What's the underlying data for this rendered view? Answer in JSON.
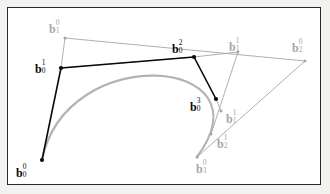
{
  "figure": {
    "type": "geometric-diagram",
    "background_color": "#f2f2f0",
    "panel_color": "#ffffff",
    "border_color": "#2a2a2a",
    "dark_color": "#0a0a0a",
    "gray_color": "#a6a6a6",
    "curve_color": "#b3b3b3"
  },
  "points": [
    {
      "id": "b0_0",
      "base": "b",
      "sub": "0",
      "sup": "0",
      "x": 42,
      "y": 160,
      "color": "dark",
      "label_x": 16,
      "label_y": 164,
      "dot": true
    },
    {
      "id": "b0_1",
      "base": "b",
      "sub": "0",
      "sup": "1",
      "x": 61,
      "y": 68,
      "color": "dark",
      "label_x": 35,
      "label_y": 60,
      "dot": true
    },
    {
      "id": "b0_2",
      "base": "b",
      "sub": "0",
      "sup": "2",
      "x": 194,
      "y": 57,
      "color": "dark",
      "label_x": 172,
      "label_y": 40,
      "dot": true
    },
    {
      "id": "b0_3",
      "base": "b",
      "sub": "0",
      "sup": "3",
      "x": 216,
      "y": 99,
      "color": "dark",
      "label_x": 190,
      "label_y": 98,
      "dot": true
    },
    {
      "id": "b1_0",
      "base": "b",
      "sub": "1",
      "sup": "0",
      "x": 65,
      "y": 38,
      "color": "gray",
      "label_x": 49,
      "label_y": 20,
      "dot": true
    },
    {
      "id": "b1_1",
      "base": "b",
      "sub": "1",
      "sup": "1",
      "x": 238,
      "y": 52,
      "color": "gray",
      "label_x": 229,
      "label_y": 38,
      "dot": true
    },
    {
      "id": "b1_1b",
      "base": "b",
      "sub": "1",
      "sup": "1",
      "x": 221,
      "y": 111,
      "color": "gray",
      "label_x": 226,
      "label_y": 110,
      "dot": true
    },
    {
      "id": "b2_0",
      "base": "b",
      "sub": "2",
      "sup": "0",
      "x": 305,
      "y": 61,
      "color": "gray",
      "label_x": 292,
      "label_y": 39,
      "dot": true
    },
    {
      "id": "b2_1",
      "base": "b",
      "sub": "2",
      "sup": "1",
      "x": 211,
      "y": 134,
      "color": "gray",
      "label_x": 217,
      "label_y": 135,
      "dot": true
    },
    {
      "id": "b3_0",
      "base": "b",
      "sub": "3",
      "sup": "0",
      "x": 197,
      "y": 157,
      "color": "gray",
      "label_x": 196,
      "label_y": 160,
      "dot": true
    }
  ],
  "polylines": [
    {
      "name": "original-control-polygon",
      "color": "#a6a6a6",
      "width": 0.9,
      "path": "61,68 65,38 305,61 197,157"
    },
    {
      "name": "first-subdivision-polygon",
      "color": "#a6a6a6",
      "width": 0.9,
      "path": "61,68 194,57 238,52 211,134"
    },
    {
      "name": "second-subdivision-polygon",
      "color": "#a6a6a6",
      "width": 0.9,
      "path": "194,57 216,99 221,111"
    },
    {
      "name": "casteljau-polygon-dark",
      "color": "#0a0a0a",
      "width": 1.6,
      "path": "42,160 61,68 194,57 216,99"
    }
  ],
  "curve": {
    "name": "cubic-bezier-curve",
    "color": "#b3b3b3",
    "width": 2.2,
    "start": [
      42,
      160
    ],
    "control1": [
      66,
      40
    ],
    "control2": [
      272,
      56
    ],
    "end": [
      197,
      157
    ]
  }
}
